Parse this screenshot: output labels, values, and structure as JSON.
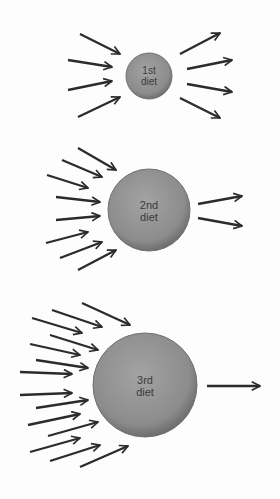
{
  "diagram": {
    "colors": {
      "circle": "#8e8e8e",
      "circle_edge": "#6f6f6f",
      "arrow": "#2b2b2b",
      "text": "#3a3a3a"
    },
    "stages": [
      {
        "label_line1": "1st",
        "label_line2": "diet",
        "arrows_in": 4,
        "arrows_out": 4
      },
      {
        "label_line1": "2nd",
        "label_line2": "diet",
        "arrows_in": 8,
        "arrows_out": 2
      },
      {
        "label_line1": "3rd",
        "label_line2": "diet",
        "arrows_in": 15,
        "arrows_out": 1
      }
    ]
  }
}
